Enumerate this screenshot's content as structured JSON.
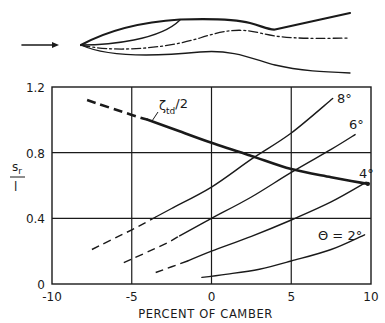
{
  "figure": {
    "diagram": {
      "flow_arrow": "flow-direction-arrow",
      "description": "Airfoil profile with camber line (dash-dot), thin inner upper contour and thick outer upper contour"
    },
    "colors": {
      "ink": "#1a1a1a",
      "grid": "#1a1a1a",
      "background": "#ffffff"
    }
  },
  "chart_data": {
    "type": "line",
    "title": "",
    "xlabel": "PERCENT OF CAMBER",
    "ylabel": "s_r / l",
    "ylabel_num": "s",
    "ylabel_sub": "r",
    "ylabel_den": "l",
    "xlim": [
      -10,
      10
    ],
    "ylim": [
      0,
      1.2
    ],
    "xticks": [
      -10,
      -5,
      0,
      5,
      10
    ],
    "xtick_labels": [
      "-10",
      "-5",
      "0",
      "5",
      "10"
    ],
    "yticks": [
      0,
      0.4,
      0.8,
      1.2
    ],
    "ytick_labels": [
      "0",
      "0.4",
      "0.8",
      "1.2"
    ],
    "grid": true,
    "legend": "inline labels",
    "series": [
      {
        "name": "ζ_td/2",
        "label_main": "ζ",
        "label_sub": "td",
        "label_suffix": "/2",
        "style": "thick",
        "dashed_until_x": -4,
        "points": [
          [
            -7.8,
            1.12
          ],
          [
            -5,
            1.03
          ],
          [
            -4,
            1.0
          ],
          [
            -2,
            0.93
          ],
          [
            0,
            0.86
          ],
          [
            2.5,
            0.78
          ],
          [
            5,
            0.7
          ],
          [
            7.5,
            0.65
          ],
          [
            9.8,
            0.61
          ]
        ]
      },
      {
        "name": "θ = 8°",
        "label": "8°",
        "style": "thin",
        "dashed_until_x": -3.5,
        "points": [
          [
            -7.5,
            0.21
          ],
          [
            -5,
            0.33
          ],
          [
            -2.5,
            0.46
          ],
          [
            0,
            0.59
          ],
          [
            2.5,
            0.76
          ],
          [
            5,
            0.92
          ],
          [
            7.6,
            1.13
          ]
        ]
      },
      {
        "name": "θ = 6°",
        "label": "6°",
        "style": "thin",
        "dashed_until_x": -2,
        "points": [
          [
            -5.5,
            0.13
          ],
          [
            -3,
            0.24
          ],
          [
            0,
            0.4
          ],
          [
            2.5,
            0.53
          ],
          [
            5,
            0.68
          ],
          [
            7.5,
            0.82
          ],
          [
            9.0,
            0.91
          ]
        ]
      },
      {
        "name": "θ = 4°",
        "label": "4°",
        "style": "thin",
        "dashed_until_x": -1.5,
        "points": [
          [
            -3.5,
            0.07
          ],
          [
            -1.5,
            0.14
          ],
          [
            0,
            0.2
          ],
          [
            2.5,
            0.29
          ],
          [
            5,
            0.39
          ],
          [
            7.5,
            0.5
          ],
          [
            9.7,
            0.62
          ]
        ]
      },
      {
        "name": "θ = 2°",
        "label": "Θ = 2°",
        "style": "thin",
        "dashed_until_x": null,
        "points": [
          [
            -0.6,
            0.04
          ],
          [
            1,
            0.06
          ],
          [
            3,
            0.09
          ],
          [
            5,
            0.14
          ],
          [
            7.5,
            0.21
          ],
          [
            9.6,
            0.3
          ]
        ]
      }
    ]
  }
}
